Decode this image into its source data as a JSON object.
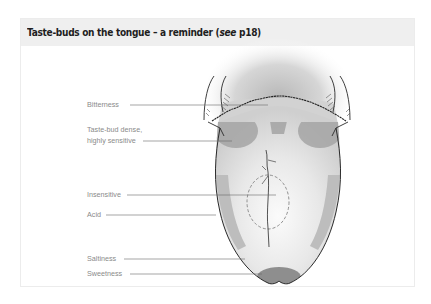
{
  "header": {
    "title_main": "Taste-buds on the tongue – a reminder (",
    "title_italic": "see",
    "title_end": " p18)"
  },
  "diagram": {
    "subject": "tongue",
    "labels": [
      {
        "id": "bitterness",
        "text": "Bitterness"
      },
      {
        "id": "dense",
        "text_line1": "Taste-bud dense,",
        "text_line2": "highly sensitive"
      },
      {
        "id": "insensitive",
        "text": "Insensitive"
      },
      {
        "id": "acid",
        "text": "Acid"
      },
      {
        "id": "saltiness",
        "text": "Saltiness"
      },
      {
        "id": "sweetness",
        "text": "Sweetness"
      }
    ]
  },
  "colors": {
    "header_bg": "#efefef",
    "title_text": "#1e1e1e",
    "label_text": "#8a8a8a",
    "leader_line": "#6a6a6a",
    "tongue_fill": "#dcdcdc",
    "taste_zone": "#9e9e9e",
    "outline": "#2a2a2a"
  }
}
